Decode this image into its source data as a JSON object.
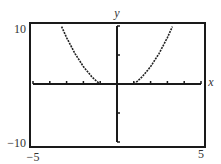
{
  "chart_data": {
    "type": "line",
    "title": "",
    "xlabel": "x",
    "ylabel": "y",
    "xlim": [
      -5,
      5
    ],
    "ylim": [
      -10,
      10
    ],
    "x_tick_step": 1,
    "y_tick_step": 5,
    "window_labels": {
      "ymax": "10",
      "ymin": "−10",
      "xmin": "−5",
      "xmax": "5"
    },
    "grid": false,
    "legend": "none",
    "series": [
      {
        "name": "left-branch",
        "x": [
          -3.3,
          -3.0,
          -2.5,
          -2.0,
          -1.5,
          -1.2,
          -1.0
        ],
        "y": [
          9.9,
          8.0,
          5.25,
          3.0,
          1.25,
          0.44,
          0.0
        ]
      },
      {
        "name": "right-branch",
        "x": [
          1.0,
          1.2,
          1.5,
          2.0,
          2.5,
          3.0,
          3.3
        ],
        "y": [
          0.0,
          0.44,
          1.25,
          3.0,
          5.25,
          8.0,
          9.9
        ]
      }
    ],
    "colors": {
      "frame": "#1a1a1a",
      "curve": "#222222",
      "text": "#333333"
    }
  }
}
